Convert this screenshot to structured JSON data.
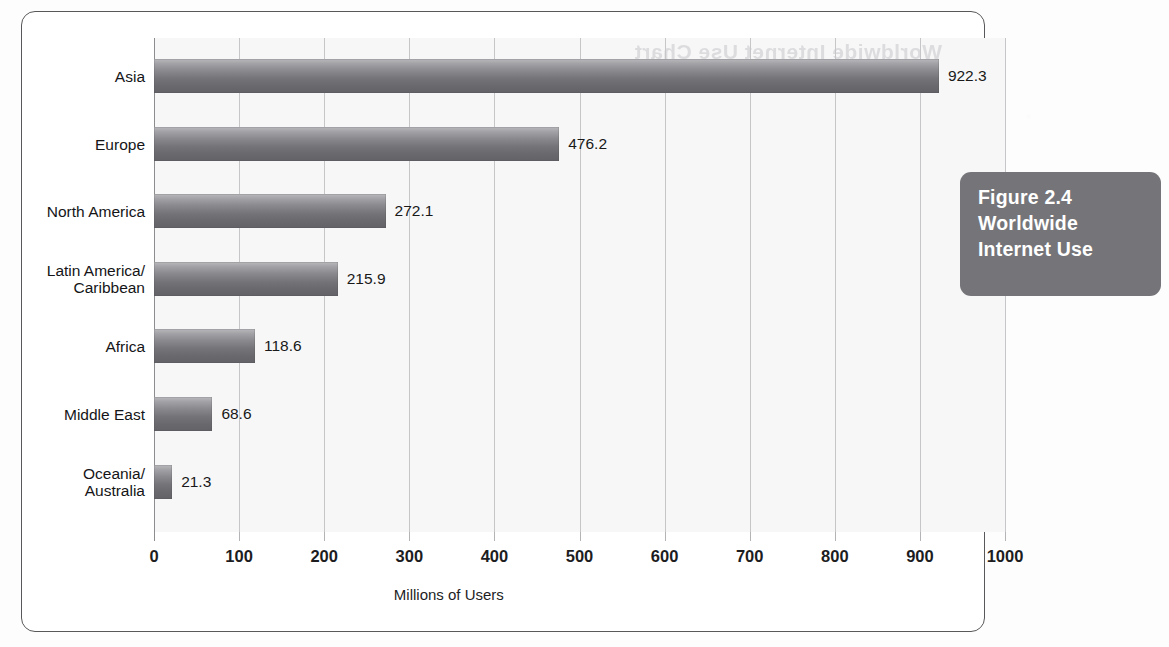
{
  "figure": {
    "caption_lines": [
      "Figure 2.4",
      "Worldwide",
      "Internet Use"
    ],
    "bleed_text": "Worldwide Internet Use Chart",
    "accent_box_color": "#757579",
    "bar_color": "#8a8a8e",
    "frame_color": "#58585a"
  },
  "chart_data": {
    "type": "bar",
    "orientation": "horizontal",
    "title": "Figure 2.4 Worldwide Internet Use",
    "xlabel": "Millions of Users",
    "ylabel": "",
    "xlim": [
      0,
      1000
    ],
    "grid": true,
    "legend": "none",
    "categories": [
      "Asia",
      "Europe",
      "North America",
      "Latin America/\nCaribbean",
      "Africa",
      "Middle East",
      "Oceania/\nAustralia"
    ],
    "values": [
      922.3,
      476.2,
      272.1,
      215.9,
      118.6,
      68.6,
      21.3
    ],
    "value_labels": [
      "922.3",
      "476.2",
      "272.1",
      "215.9",
      "118.6",
      "68.6",
      "21.3"
    ],
    "xticks": [
      0,
      100,
      200,
      300,
      400,
      500,
      600,
      700,
      800,
      900,
      1000
    ],
    "xtick_labels": [
      "0",
      "100",
      "200",
      "300",
      "400",
      "500",
      "600",
      "700",
      "800",
      "900",
      "1000"
    ]
  }
}
